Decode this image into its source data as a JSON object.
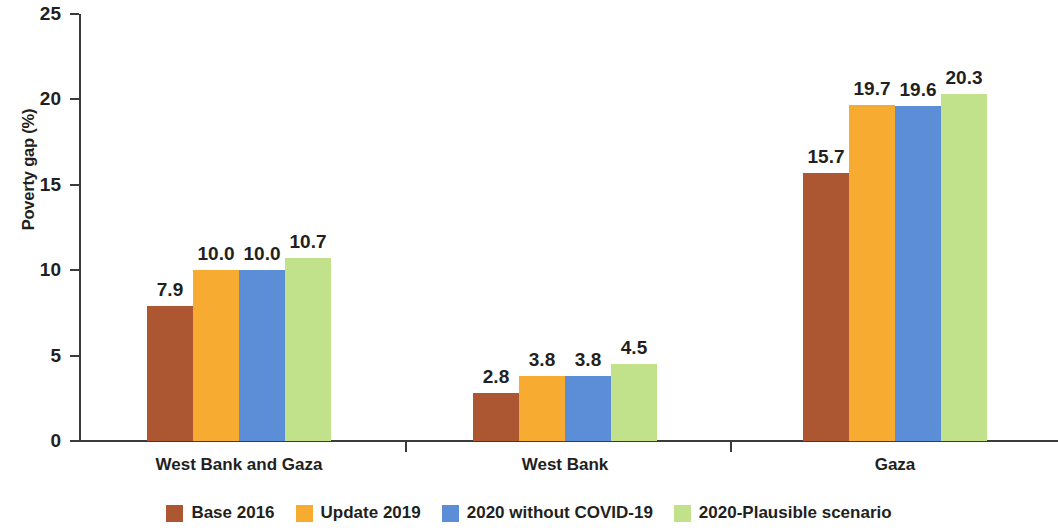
{
  "chart_data": {
    "type": "bar",
    "title": "",
    "xlabel": "",
    "ylabel": "Poverty gap (%)",
    "ylim": [
      0,
      25
    ],
    "yticks": [
      "0",
      "5",
      "10",
      "15",
      "20",
      "25"
    ],
    "grid": false,
    "legend_position": "bottom",
    "categories": [
      "West Bank and Gaza",
      "West Bank",
      "Gaza"
    ],
    "series": [
      {
        "name": "Base 2016",
        "color": "#ad5732",
        "values": [
          7.9,
          2.8,
          15.7
        ],
        "labels": [
          "7.9",
          "2.8",
          "15.7"
        ]
      },
      {
        "name": "Update 2019",
        "color": "#f7ab31",
        "values": [
          10.0,
          3.8,
          19.7
        ],
        "labels": [
          "10.0",
          "3.8",
          "19.7"
        ]
      },
      {
        "name": "2020 without COVID-19",
        "color": "#5b8ed6",
        "values": [
          10.0,
          3.8,
          19.6
        ],
        "labels": [
          "10.0",
          "3.8",
          "19.6"
        ]
      },
      {
        "name": "2020-Plausible scenario",
        "color": "#c2e18b",
        "values": [
          10.7,
          4.5,
          20.3
        ],
        "labels": [
          "10.7",
          "4.5",
          "20.3"
        ]
      }
    ]
  },
  "axis": {
    "line_color": "#3b3b3b"
  }
}
